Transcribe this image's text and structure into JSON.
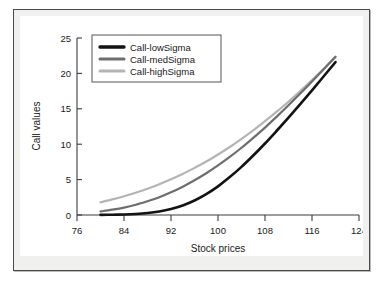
{
  "chart_data": {
    "type": "line",
    "title": "",
    "xlabel": "Stock prices",
    "ylabel": "Call values",
    "xlim": [
      76,
      124
    ],
    "ylim": [
      0,
      25
    ],
    "xticks": [
      76,
      84,
      92,
      100,
      108,
      116,
      124
    ],
    "yticks": [
      0,
      5,
      10,
      15,
      20,
      25
    ],
    "grid": false,
    "legend_position": "upper-left",
    "x": [
      80,
      82,
      84,
      86,
      88,
      90,
      92,
      94,
      96,
      98,
      100,
      102,
      104,
      106,
      108,
      110,
      112,
      114,
      116,
      118,
      120
    ],
    "series": [
      {
        "name": "Call-lowSigma",
        "color": "#131313",
        "values": [
          0.02,
          0.04,
          0.08,
          0.15,
          0.28,
          0.5,
          0.85,
          1.35,
          2.05,
          2.95,
          4.05,
          5.35,
          6.8,
          8.4,
          10.1,
          11.9,
          13.75,
          15.65,
          17.6,
          19.6,
          21.6
        ]
      },
      {
        "name": "Call-medSigma",
        "color": "#6e6e6e",
        "values": [
          0.5,
          0.75,
          1.05,
          1.45,
          1.95,
          2.5,
          3.2,
          4.0,
          4.9,
          5.9,
          7.0,
          8.2,
          9.5,
          10.9,
          12.35,
          13.9,
          15.5,
          17.15,
          18.85,
          20.6,
          22.35
        ]
      },
      {
        "name": "Call-highSigma",
        "color": "#b4b4b4",
        "values": [
          1.8,
          2.2,
          2.65,
          3.15,
          3.7,
          4.35,
          5.05,
          5.8,
          6.65,
          7.55,
          8.55,
          9.6,
          10.75,
          11.95,
          13.25,
          14.6,
          16.0,
          17.5,
          19.05,
          20.65,
          22.3
        ]
      }
    ]
  },
  "legend": {
    "items": [
      {
        "label": "Call-lowSigma"
      },
      {
        "label": "Call-medSigma"
      },
      {
        "label": "Call-highSigma"
      }
    ]
  },
  "axes": {
    "x_title": "Stock prices",
    "y_title": "Call values",
    "x_tick_labels": [
      "76",
      "84",
      "92",
      "100",
      "108",
      "116",
      "124"
    ],
    "y_tick_labels": [
      "0",
      "5",
      "10",
      "15",
      "20",
      "25"
    ]
  }
}
